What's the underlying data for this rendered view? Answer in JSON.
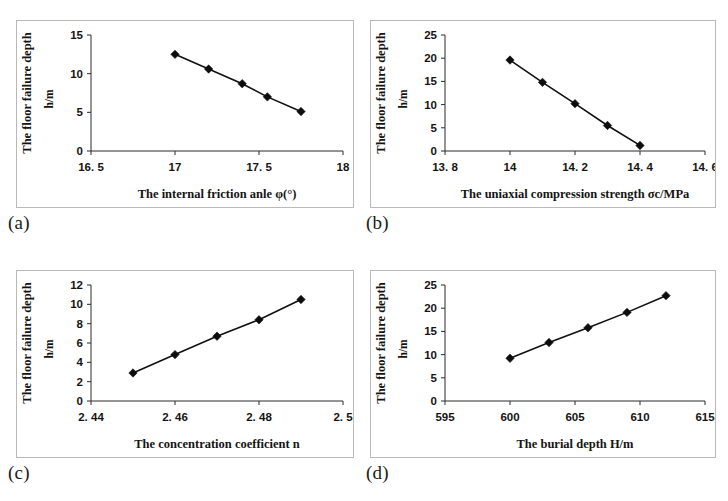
{
  "figure": {
    "panels": [
      {
        "caption": "(a)",
        "chart_data": {
          "type": "line",
          "title": "",
          "xlabel": "The internal friction anle φ(°)",
          "ylabel": "The floor failure depth",
          "ylabel_unit": "h/m",
          "x": [
            17,
            17.2,
            17.4,
            17.55,
            17.75
          ],
          "values": [
            12.5,
            10.6,
            8.7,
            7.0,
            5.1
          ],
          "xlim": [
            16.5,
            18
          ],
          "ylim": [
            0,
            15
          ],
          "xticks": [
            16.5,
            17,
            17.5,
            18
          ],
          "xticklabels": [
            "16. 5",
            "17",
            "17. 5",
            "18"
          ],
          "yticks": [
            0,
            5,
            10,
            15
          ],
          "yticklabels": [
            "0",
            "5",
            "10",
            "15"
          ],
          "grid": false,
          "legend": "none",
          "marker": "diamond"
        }
      },
      {
        "caption": "(b)",
        "chart_data": {
          "type": "line",
          "title": "",
          "xlabel": "The uniaxial compression strength σc/MPa",
          "ylabel": "The floor failure depth",
          "ylabel_unit": "h/m",
          "x": [
            14,
            14.1,
            14.2,
            14.3,
            14.4
          ],
          "values": [
            19.6,
            14.8,
            10.2,
            5.5,
            1.2
          ],
          "xlim": [
            13.8,
            14.6
          ],
          "ylim": [
            0,
            25
          ],
          "xticks": [
            13.8,
            14,
            14.2,
            14.4,
            14.6
          ],
          "xticklabels": [
            "13. 8",
            "14",
            "14. 2",
            "14. 4",
            "14. 6"
          ],
          "yticks": [
            0,
            5,
            10,
            15,
            20,
            25
          ],
          "yticklabels": [
            "0",
            "5",
            "10",
            "15",
            "20",
            "25"
          ],
          "grid": false,
          "legend": "none",
          "marker": "diamond"
        }
      },
      {
        "caption": "(c)",
        "chart_data": {
          "type": "line",
          "title": "",
          "xlabel": "The concentration coefficient n",
          "ylabel": "The floor failure depth",
          "ylabel_unit": "h/m",
          "x": [
            2.45,
            2.46,
            2.47,
            2.48,
            2.49
          ],
          "values": [
            2.9,
            4.8,
            6.7,
            8.4,
            10.5
          ],
          "xlim": [
            2.44,
            2.5
          ],
          "ylim": [
            0,
            12
          ],
          "xticks": [
            2.44,
            2.46,
            2.48,
            2.5
          ],
          "xticklabels": [
            "2. 44",
            "2. 46",
            "2. 48",
            "2. 5"
          ],
          "yticks": [
            0,
            2,
            4,
            6,
            8,
            10,
            12
          ],
          "yticklabels": [
            "0",
            "2",
            "4",
            "6",
            "8",
            "10",
            "12"
          ],
          "grid": false,
          "legend": "none",
          "marker": "diamond"
        }
      },
      {
        "caption": "(d)",
        "chart_data": {
          "type": "line",
          "title": "",
          "xlabel": "The burial depth H/m",
          "ylabel": "The floor failure depth",
          "ylabel_unit": "h/m",
          "x": [
            600,
            603,
            606,
            609,
            612
          ],
          "values": [
            9.2,
            12.6,
            15.8,
            19.1,
            22.7
          ],
          "xlim": [
            595,
            615
          ],
          "ylim": [
            0,
            25
          ],
          "xticks": [
            595,
            600,
            605,
            610,
            615
          ],
          "xticklabels": [
            "595",
            "600",
            "605",
            "610",
            "615"
          ],
          "yticks": [
            0,
            5,
            10,
            15,
            20,
            25
          ],
          "yticklabels": [
            "0",
            "5",
            "10",
            "15",
            "20",
            "25"
          ],
          "grid": false,
          "legend": "none",
          "marker": "diamond"
        }
      }
    ],
    "colors": {
      "marker": "#0d0d0d",
      "line": "#101010",
      "axis": "#2a2a2a",
      "panel_border": "#b9b9b9",
      "background": "#ffffff"
    }
  }
}
